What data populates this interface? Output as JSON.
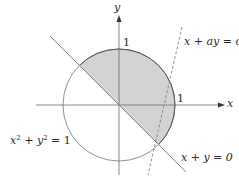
{
  "figure": {
    "type": "diagram",
    "colors": {
      "background": "#ffffff",
      "stroke": "#555555",
      "axis": "#6a6a6a",
      "shade": "#d3d3d3",
      "text": "#2a2a2a"
    }
  },
  "axes": {
    "x_label": "x",
    "y_label": "y",
    "x_tick": "1",
    "y_tick": "1"
  },
  "labels": {
    "circle_eq_base_x": "x",
    "circle_eq_exp": "2",
    "circle_eq_plus": " + ",
    "circle_eq_base_y": "y",
    "circle_eq_rhs": " = 1",
    "line1": "x + y = 0",
    "line2": "x + ay = c"
  }
}
